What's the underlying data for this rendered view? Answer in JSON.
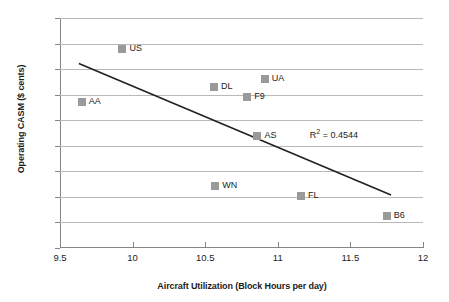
{
  "chart_data": {
    "type": "scatter",
    "title": "",
    "xlabel": "Aircraft Utilization (Block Hours per day)",
    "ylabel": "Operating CASM ($ cents)",
    "xlim": [
      9.5,
      12
    ],
    "ylim": [
      10,
      19
    ],
    "x_ticks": [
      "9.5",
      "10",
      "10.5",
      "11",
      "11.5",
      "12"
    ],
    "x_tick_values": [
      9.5,
      10,
      10.5,
      11,
      11.5,
      12
    ],
    "y_ticks": [
      "10",
      "11",
      "12",
      "13",
      "14",
      "15",
      "16",
      "17",
      "18",
      "19"
    ],
    "y_tick_values": [
      10,
      11,
      12,
      13,
      14,
      15,
      16,
      17,
      18,
      19
    ],
    "grid": "horizontal",
    "legend": "none",
    "marker_color": "#9a9a9a",
    "gridline_color": "#b9b9b9",
    "axis_color": "#868686",
    "trendline_color": "#231f20",
    "points": [
      {
        "label": "AA",
        "x": 9.65,
        "y": 15.7
      },
      {
        "label": "US",
        "x": 9.93,
        "y": 17.78
      },
      {
        "label": "DL",
        "x": 10.56,
        "y": 16.3
      },
      {
        "label": "WN",
        "x": 10.57,
        "y": 12.44
      },
      {
        "label": "F9",
        "x": 10.79,
        "y": 15.92
      },
      {
        "label": "AS",
        "x": 10.86,
        "y": 14.38
      },
      {
        "label": "UA",
        "x": 10.91,
        "y": 16.63
      },
      {
        "label": "FL",
        "x": 11.16,
        "y": 12.02
      },
      {
        "label": "B6",
        "x": 11.75,
        "y": 11.26
      }
    ],
    "trendline": {
      "x_start": 9.63,
      "y_start": 17.22,
      "x_end": 11.78,
      "y_end": 12.07
    },
    "annotations": [
      {
        "name": "r-squared",
        "prefix": "R",
        "superscript": "2",
        "suffix": " = 0.4544",
        "x": 11.22,
        "y": 14.45
      }
    ]
  }
}
